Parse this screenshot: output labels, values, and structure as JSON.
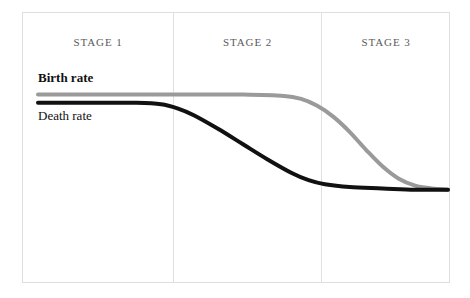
{
  "figure": {
    "kind": "demographic-transition-model",
    "background_color": "#ffffff",
    "frame_color": "#dedede",
    "divider_color": "#e0e0e0"
  },
  "stages": [
    {
      "label": "STAGE 1"
    },
    {
      "label": "STAGE 2"
    },
    {
      "label": "STAGE 3"
    }
  ],
  "series_labels": {
    "birth": "Birth rate",
    "death": "Death rate"
  },
  "chart_data": {
    "type": "line",
    "title": "",
    "subtitle": "",
    "xlabel": "",
    "ylabel": "",
    "grid": false,
    "legend_position": "inline-left",
    "annotations": [
      "STAGE 1",
      "STAGE 2",
      "STAGE 3",
      "Birth rate",
      "Death rate"
    ],
    "axis_note": "Unlabeled axes: x = time through demographic transition stages, y = rate per 1000 people",
    "xlim": [
      0,
      100
    ],
    "ylim": [
      0,
      100
    ],
    "stage_boundaries_x": [
      35,
      70
    ],
    "series": [
      {
        "name": "Birth rate",
        "color": "#9a9a9a",
        "line_width": 4,
        "x": [
          0,
          10,
          20,
          30,
          40,
          50,
          60,
          64,
          68,
          72,
          76,
          80,
          84,
          88,
          92,
          96,
          100
        ],
        "values": [
          88,
          88,
          88,
          88,
          88,
          88,
          87,
          85,
          80,
          72,
          61,
          48,
          36,
          27,
          22,
          20,
          19
        ]
      },
      {
        "name": "Death rate",
        "color": "#111111",
        "line_width": 4,
        "x": [
          0,
          8,
          16,
          24,
          30,
          34,
          38,
          44,
          50,
          56,
          62,
          66,
          70,
          76,
          84,
          92,
          100
        ],
        "values": [
          82,
          82,
          82,
          82,
          81,
          78,
          73,
          63,
          52,
          41,
          31,
          26,
          23,
          21,
          20,
          19,
          19
        ]
      }
    ]
  }
}
